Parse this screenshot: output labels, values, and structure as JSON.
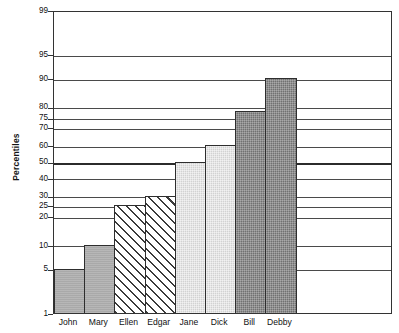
{
  "chart_data": {
    "type": "bar",
    "title": "",
    "subtitle": "",
    "xlabel": "",
    "ylabel": "Percentiles",
    "categories": [
      "John",
      "Mary",
      "Ellen",
      "Edgar",
      "Jane",
      "Dick",
      "Bill",
      "Debby"
    ],
    "values": [
      5,
      10,
      25,
      30,
      50,
      60,
      78,
      90
    ],
    "series": [
      {
        "name": "Percentiles",
        "values": [
          5,
          10,
          25,
          30,
          50,
          60,
          78,
          90
        ]
      }
    ],
    "bar_fills": [
      "gray-mid",
      "gray-mid",
      "diagonal-hatch",
      "diagonal-hatch",
      "gray-light",
      "gray-light",
      "gray-dark",
      "gray-dark"
    ],
    "ylim": [
      1,
      99
    ],
    "yticks": [
      1,
      5,
      10,
      20,
      25,
      30,
      40,
      50,
      60,
      70,
      75,
      80,
      90,
      95,
      99
    ],
    "ytick_labels": [
      "1",
      "5",
      "10",
      "20",
      "25",
      "30",
      "40",
      "50",
      "60",
      "70",
      "75",
      "80",
      "90",
      "95",
      "99"
    ],
    "y_major_ticks": [
      50
    ],
    "y_scale": "normal-probability",
    "grid": true,
    "grid_axis": "y",
    "legend": false,
    "legend_position": "none",
    "colors": {
      "axis": "#333333",
      "gridline": "#4a4a4a",
      "gridline_major": "#2b2b2b",
      "bar_gray_mid": "#a9a9a9",
      "bar_gray_light": "#d2d2d2",
      "bar_gray_dark": "#717171",
      "bar_border": "#2e2e2e",
      "background": "#ffffff",
      "text": "#111111"
    }
  }
}
